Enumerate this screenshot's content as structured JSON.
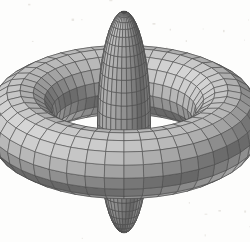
{
  "figure": {
    "kind": "3d-surface-wireframe",
    "background_color": "#fdfdfc",
    "mesh_line_color": "#4a4a4a",
    "mesh_line_width": 0.55,
    "width": 250,
    "height": 242
  },
  "chart_data": {
    "type": "surface3d",
    "title": "",
    "xlabel": "",
    "ylabel": "",
    "zlabel": "",
    "grid": false,
    "legend": "none",
    "axes_visible": false,
    "tick_labels": [],
    "annotations": [],
    "camera": {
      "elevation_deg": 24,
      "azimuth_deg": 0,
      "projection": "orthographic",
      "center_x": 124,
      "center_y": 122,
      "scale": 104
    },
    "light": {
      "direction": [
        -0.48,
        -0.38,
        0.79
      ],
      "ambient": 0.46,
      "diffuse": 0.54,
      "base_gray": 190,
      "min_gray": 104,
      "max_gray": 226
    },
    "surfaces": [
      {
        "name": "torus",
        "type": "torus",
        "major_radius": 1.0,
        "minor_radius": 0.33,
        "u_segments": 44,
        "v_segments": 16,
        "color": "#a9a9a9"
      },
      {
        "name": "spindle",
        "type": "ellipsoid",
        "center": [
          0,
          0,
          0
        ],
        "radius_x": 0.255,
        "radius_y": 0.255,
        "radius_z": 1.16,
        "u_segments": 30,
        "v_segments": 26,
        "color": "#ababab"
      }
    ]
  }
}
